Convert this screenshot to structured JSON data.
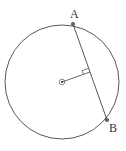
{
  "diagram": {
    "title": "",
    "colors": {
      "stroke": "#444444",
      "point": "#666666",
      "label": "#333333",
      "background": "#ffffff"
    },
    "circle": {
      "cx": 62,
      "cy": 82,
      "r": 57
    },
    "center": {
      "x": 62,
      "y": 82,
      "marker": "dot-in-circle"
    },
    "points": [
      {
        "id": "A",
        "label": "A",
        "x": 73,
        "y": 24,
        "label_x": 70,
        "label_y": 18
      },
      {
        "id": "B",
        "label": "B",
        "x": 107,
        "y": 120,
        "label_x": 109,
        "label_y": 132
      }
    ],
    "chord": {
      "from": "A",
      "to": "B"
    },
    "perpendicular": {
      "from": "center",
      "foot_x": 90,
      "foot_y": 72,
      "right_angle_marker": true
    }
  }
}
